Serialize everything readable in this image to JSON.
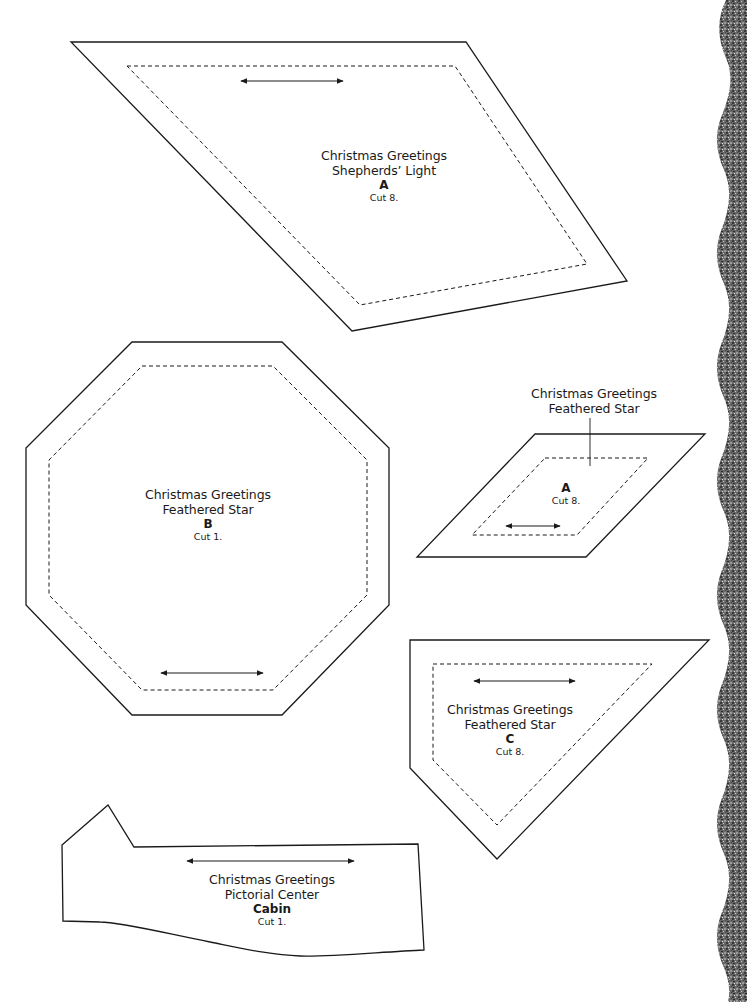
{
  "page": {
    "type": "quilt-pattern-templates",
    "background": "#ffffff",
    "line_color": "#1a1a1a",
    "border_texture_color": "#5a5a5a"
  },
  "templates": [
    {
      "id": "shepherds-light-a",
      "lines": [
        "Christmas Greetings",
        "Shepherds’ Light"
      ],
      "piece": "A",
      "cut": "Cut 8."
    },
    {
      "id": "feathered-star-b",
      "lines": [
        "Christmas Greetings",
        "Feathered Star"
      ],
      "piece": "B",
      "cut": "Cut 1."
    },
    {
      "id": "feathered-star-a",
      "lines": [
        "Christmas Greetings",
        "Feathered Star"
      ],
      "piece": "A",
      "cut": "Cut 8."
    },
    {
      "id": "feathered-star-c",
      "lines": [
        "Christmas Greetings",
        "Feathered Star"
      ],
      "piece": "C",
      "cut": "Cut 8."
    },
    {
      "id": "pictorial-center-cabin",
      "lines": [
        "Christmas Greetings",
        "Pictorial Center"
      ],
      "piece": "Cabin",
      "cut": "Cut 1."
    }
  ],
  "icons": {
    "grainline": "double-headed-arrow"
  }
}
